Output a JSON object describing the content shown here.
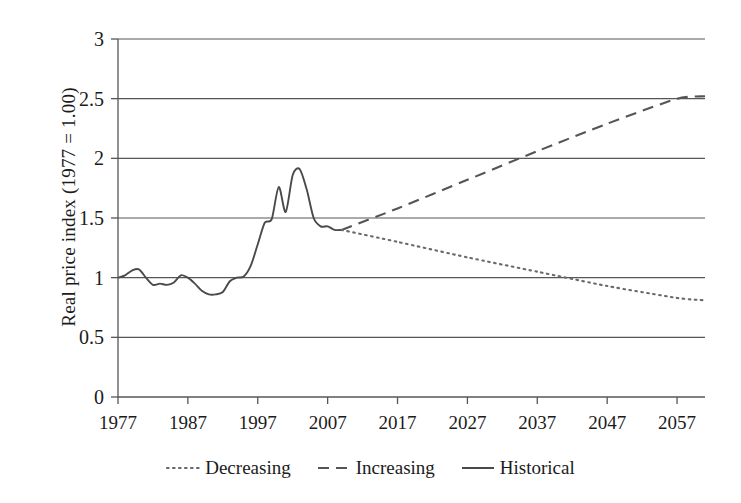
{
  "chart_data": {
    "type": "line",
    "title": "",
    "xlabel": "",
    "ylabel": "Real price index (1977 = 1.00)",
    "xlim": [
      1977,
      2061
    ],
    "ylim": [
      0,
      3
    ],
    "grid": true,
    "grid_axis": "y",
    "legend_position": "bottom",
    "xticks": [
      "1977",
      "1987",
      "1997",
      "2007",
      "2017",
      "2027",
      "2037",
      "2047",
      "2057"
    ],
    "xtick_values": [
      1977,
      1987,
      1997,
      2007,
      2017,
      2027,
      2037,
      2047,
      2057
    ],
    "yticks": [
      "0",
      "0.5",
      "1",
      "1.5",
      "2",
      "2.5",
      "3"
    ],
    "ytick_values": [
      0,
      0.5,
      1,
      1.5,
      2,
      2.5,
      3
    ],
    "series": [
      {
        "name": "Historical",
        "style": "solid",
        "color": "#4a4a4a",
        "points": [
          [
            1977,
            1.0
          ],
          [
            1978,
            1.02
          ],
          [
            1979,
            1.06
          ],
          [
            1980,
            1.07
          ],
          [
            1981,
            1.0
          ],
          [
            1982,
            0.94
          ],
          [
            1983,
            0.95
          ],
          [
            1984,
            0.94
          ],
          [
            1985,
            0.96
          ],
          [
            1986,
            1.02
          ],
          [
            1987,
            1.0
          ],
          [
            1988,
            0.95
          ],
          [
            1989,
            0.89
          ],
          [
            1990,
            0.86
          ],
          [
            1991,
            0.86
          ],
          [
            1992,
            0.88
          ],
          [
            1993,
            0.97
          ],
          [
            1994,
            1.0
          ],
          [
            1995,
            1.01
          ],
          [
            1996,
            1.1
          ],
          [
            1997,
            1.28
          ],
          [
            1998,
            1.46
          ],
          [
            1999,
            1.49
          ],
          [
            2000,
            1.76
          ],
          [
            2001,
            1.55
          ],
          [
            2002,
            1.86
          ],
          [
            2003,
            1.91
          ],
          [
            2004,
            1.74
          ],
          [
            2005,
            1.5
          ],
          [
            2006,
            1.43
          ],
          [
            2007,
            1.43
          ],
          [
            2008,
            1.4
          ],
          [
            2009,
            1.4
          ]
        ]
      },
      {
        "name": "Increasing",
        "style": "dashed",
        "color": "#555555",
        "points": [
          [
            2009,
            1.4
          ],
          [
            2017,
            1.58
          ],
          [
            2027,
            1.82
          ],
          [
            2037,
            2.06
          ],
          [
            2047,
            2.29
          ],
          [
            2057,
            2.5
          ],
          [
            2061,
            2.52
          ]
        ]
      },
      {
        "name": "Decreasing",
        "style": "dotted",
        "color": "#6a6a6a",
        "points": [
          [
            2009,
            1.4
          ],
          [
            2017,
            1.3
          ],
          [
            2027,
            1.17
          ],
          [
            2037,
            1.05
          ],
          [
            2047,
            0.93
          ],
          [
            2057,
            0.83
          ],
          [
            2061,
            0.81
          ]
        ]
      }
    ],
    "legend": [
      {
        "label": "Decreasing",
        "style": "dotted"
      },
      {
        "label": "Increasing",
        "style": "dashed"
      },
      {
        "label": "Historical",
        "style": "solid"
      }
    ]
  }
}
